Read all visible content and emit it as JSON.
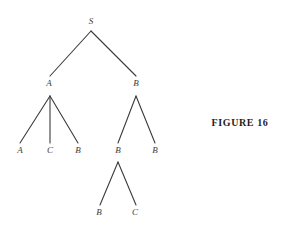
{
  "figure": {
    "caption": "FIGURE  16",
    "caption_x": 240,
    "caption_y": 122,
    "background_color": "#ffffff",
    "edge_color": "#3b3b3b",
    "label_color": "#3b3b3b",
    "caption_color": "#1d1d1d",
    "width": 282,
    "height": 231
  },
  "tree": {
    "description": "Syntactic derivation / parse tree with root S",
    "nodes": [
      {
        "id": "n0",
        "label": "S",
        "x": 91,
        "y": 21,
        "level": 0
      },
      {
        "id": "n1",
        "label": "A",
        "x": 49,
        "y": 83,
        "level": 1
      },
      {
        "id": "n2",
        "label": "B",
        "x": 136,
        "y": 83,
        "level": 1
      },
      {
        "id": "n3",
        "label": "A",
        "x": 20,
        "y": 150,
        "level": 2
      },
      {
        "id": "n4",
        "label": "C",
        "x": 50,
        "y": 150,
        "level": 2
      },
      {
        "id": "n5",
        "label": "B",
        "x": 78,
        "y": 150,
        "level": 2
      },
      {
        "id": "n6",
        "label": "B",
        "x": 118,
        "y": 150,
        "level": 2
      },
      {
        "id": "n7",
        "label": "B",
        "x": 155,
        "y": 150,
        "level": 2
      },
      {
        "id": "n8",
        "label": "B",
        "x": 99,
        "y": 212,
        "level": 3
      },
      {
        "id": "n9",
        "label": "C",
        "x": 135,
        "y": 212,
        "level": 3
      }
    ],
    "edges": [
      {
        "from": "n0",
        "to": "n1",
        "x1": 91,
        "y1": 31,
        "x2": 50,
        "y2": 76
      },
      {
        "from": "n0",
        "to": "n2",
        "x1": 91,
        "y1": 31,
        "x2": 136,
        "y2": 76
      },
      {
        "from": "n1",
        "to": "n3",
        "x1": 50,
        "y1": 96,
        "x2": 20,
        "y2": 143
      },
      {
        "from": "n1",
        "to": "n4",
        "x1": 50,
        "y1": 96,
        "x2": 50,
        "y2": 143
      },
      {
        "from": "n1",
        "to": "n5",
        "x1": 50,
        "y1": 96,
        "x2": 78,
        "y2": 143
      },
      {
        "from": "n2",
        "to": "n6",
        "x1": 136,
        "y1": 96,
        "x2": 118,
        "y2": 143
      },
      {
        "from": "n2",
        "to": "n7",
        "x1": 136,
        "y1": 96,
        "x2": 155,
        "y2": 143
      },
      {
        "from": "n6",
        "to": "n8",
        "x1": 118,
        "y1": 162,
        "x2": 100,
        "y2": 205
      },
      {
        "from": "n6",
        "to": "n9",
        "x1": 118,
        "y1": 162,
        "x2": 136,
        "y2": 205
      }
    ],
    "productions": [
      "S -> A B",
      "A -> A C B",
      "B -> B B",
      "B -> B C"
    ]
  }
}
